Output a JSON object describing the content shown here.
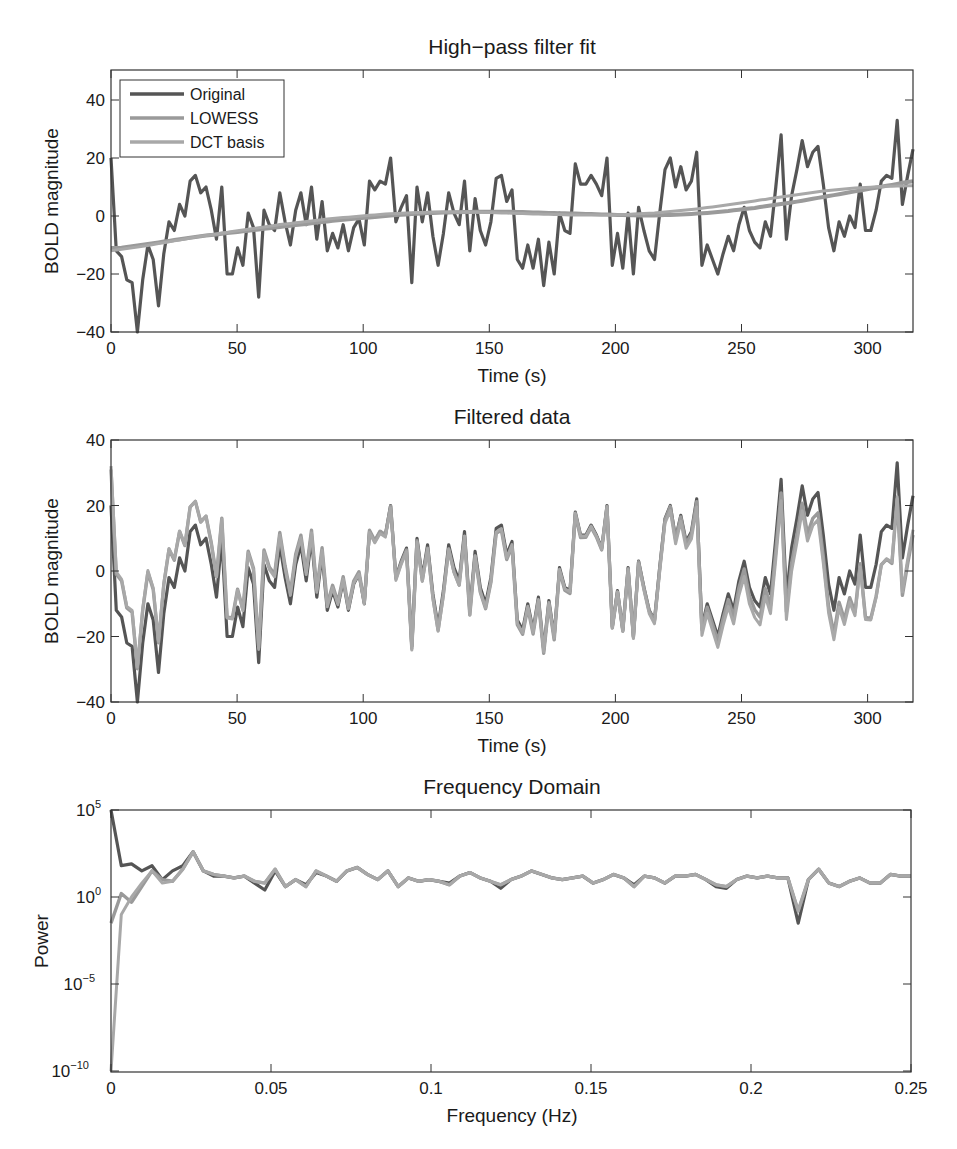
{
  "colors": {
    "original": "#555555",
    "lowess": "#9a9a9a",
    "dct": "#a8a8a8",
    "axis": "#333333"
  },
  "chart_data": [
    {
      "type": "line",
      "title": "High−pass filter fit",
      "xlabel": "Time (s)",
      "ylabel": "BOLD magnitude",
      "xlim": [
        0,
        318
      ],
      "ylim": [
        -40,
        50
      ],
      "xticks": [
        0,
        50,
        100,
        150,
        200,
        250,
        300
      ],
      "yticks": [
        -40,
        -20,
        0,
        20,
        40
      ],
      "grid": false,
      "legend": {
        "position": "upper left",
        "entries": [
          "Original",
          "LOWESS",
          "DCT basis"
        ]
      },
      "dt": 2.5,
      "series": [
        {
          "name": "Original",
          "values": [
            20,
            -12,
            -14,
            -22,
            -23,
            -40,
            -22,
            -10,
            -15,
            -31,
            -13,
            -2,
            -5,
            4,
            0,
            12,
            14,
            8,
            10,
            2,
            -8,
            10,
            -20,
            -20,
            -11,
            -17,
            1,
            -4,
            -28,
            2,
            -3,
            -5,
            8,
            -2,
            -10,
            2,
            8,
            -3,
            10,
            -8,
            5,
            -12,
            -6,
            -11,
            -3,
            -12,
            -4,
            -1,
            -10,
            12,
            9,
            12,
            11,
            20,
            -2,
            3,
            7,
            -23,
            10,
            -2,
            8,
            -7,
            -17,
            -6,
            8,
            1,
            -3,
            12,
            -12,
            6,
            -5,
            -10,
            -2,
            13,
            14,
            5,
            9,
            -15,
            -18,
            -10,
            -18,
            -8,
            -24,
            -9,
            -20,
            1,
            -5,
            -6,
            18,
            11,
            11,
            14,
            11,
            7,
            20,
            -17,
            -6,
            -18,
            1,
            -20,
            3,
            -5,
            -12,
            -15,
            1,
            16,
            20,
            10,
            17,
            9,
            12,
            22,
            -17,
            -10,
            -15,
            -20,
            -13,
            -7,
            -12,
            -3,
            3,
            -5,
            -9,
            -11,
            -2,
            -7,
            10,
            28,
            -8,
            7,
            16,
            26,
            17,
            22,
            24,
            11,
            -4,
            -12,
            -2,
            -7,
            0,
            -4,
            11,
            -5,
            -5,
            2,
            12,
            14,
            13,
            33,
            4,
            14,
            23
          ]
        },
        {
          "name": "LOWESS",
          "values": [
            -11,
            -11,
            -10.5,
            -10,
            -9.5,
            -9,
            -8.5,
            -8,
            -7.5,
            -7,
            -6.6,
            -6.2,
            -5.8,
            -5.4,
            -5,
            -4.6,
            -4.2,
            -3.8,
            -3.4,
            -3,
            -2.6,
            -2.2,
            -1.8,
            -1.4,
            -1.1,
            -0.8,
            -0.5,
            -0.2,
            0.1,
            0.4,
            0.6,
            0.8,
            1,
            1.1,
            1.2,
            1.3,
            1.4,
            1.5,
            1.5,
            1.5,
            1.5,
            1.4,
            1.3,
            1.2,
            1.1,
            1,
            0.9,
            0.8,
            0.7,
            0.6,
            0.5,
            0.4,
            0.3,
            0.2,
            0.2,
            0.2,
            0.3,
            0.4,
            0.6,
            0.8,
            1,
            1.3,
            1.6,
            2,
            2.4,
            2.8,
            3.3,
            3.8,
            4.3,
            4.8,
            5.4,
            6,
            6.6,
            7.2,
            7.8,
            8.4,
            9,
            9.6,
            10.2,
            10.8,
            11.5,
            12
          ]
        },
        {
          "name": "DCT basis",
          "values": [
            -12,
            -11.5,
            -11,
            -10.5,
            -10,
            -9.4,
            -8.8,
            -8.2,
            -7.6,
            -7,
            -6.5,
            -6,
            -5.5,
            -5,
            -4.5,
            -4,
            -3.5,
            -3,
            -2.6,
            -2.2,
            -1.8,
            -1.4,
            -1,
            -0.7,
            -0.4,
            -0.1,
            0.2,
            0.5,
            0.7,
            0.9,
            1.1,
            1.2,
            1.3,
            1.4,
            1.4,
            1.4,
            1.4,
            1.3,
            1.2,
            1.1,
            1,
            0.9,
            0.8,
            0.7,
            0.6,
            0.5,
            0.4,
            0.3,
            0.3,
            0.3,
            0.3,
            0.4,
            0.5,
            0.7,
            0.9,
            1.1,
            1.4,
            1.7,
            2,
            2.4,
            2.8,
            3.2,
            3.7,
            4.2,
            4.7,
            5.2,
            5.7,
            6.2,
            6.7,
            7.2,
            7.7,
            8.2,
            8.6,
            9,
            9.3,
            9.6,
            9.8,
            10,
            10.2,
            10.3,
            10.4,
            10.4
          ]
        }
      ]
    },
    {
      "type": "line",
      "title": "Filtered data",
      "xlabel": "Time (s)",
      "ylabel": "BOLD magnitude",
      "xlim": [
        0,
        318
      ],
      "ylim": [
        -40,
        40
      ],
      "xticks": [
        0,
        50,
        100,
        150,
        200,
        250,
        300
      ],
      "yticks": [
        -40,
        -20,
        0,
        20,
        40
      ],
      "grid": false,
      "note": "Series are Original minus LOWESS fit and Original minus DCT fit, overlaid with the Original."
    },
    {
      "type": "line",
      "title": "Frequency Domain",
      "xlabel": "Frequency (Hz)",
      "ylabel": "Power",
      "xscale": "linear",
      "yscale": "log",
      "xlim": [
        0,
        0.25
      ],
      "ylim_log10": [
        -10,
        5
      ],
      "xticks": [
        0,
        0.05,
        0.1,
        0.15,
        0.2,
        0.25
      ],
      "yticks_log10": [
        -10,
        -5,
        0,
        5
      ],
      "grid": false,
      "series": [
        {
          "name": "Original",
          "log10_power": [
            5,
            1.8,
            1.9,
            1.5,
            1.8,
            1,
            1.5,
            1.8,
            2.6,
            1.5,
            1.2,
            1.2,
            1.1,
            1.2,
            0.8,
            0.4,
            1.5,
            0.6,
            1,
            0.7,
            1.4,
            1.2,
            0.9,
            1.5,
            1.7,
            1.3,
            1,
            1.5,
            0.6,
            1.1,
            0.9,
            1,
            0.9,
            0.8,
            1.2,
            1.4,
            1.1,
            0.9,
            0.5,
            1,
            1.2,
            1.5,
            1.3,
            1.1,
            1,
            1.1,
            1.2,
            0.8,
            1,
            1.3,
            1.1,
            0.7,
            1.2,
            1.1,
            0.8,
            1.2,
            1.2,
            1.3,
            1,
            0.6,
            0.5,
            1,
            1.2,
            1.1,
            1.2,
            1.1,
            1.1,
            -1.5,
            1,
            1.6,
            0.8,
            0.6,
            0.9,
            1.1,
            0.8,
            0.8,
            1.3,
            1.2,
            1.2
          ]
        },
        {
          "name": "LOWESS",
          "log10_power": [
            -1.5,
            0.2,
            -0.3,
            0.6,
            1.5,
            1,
            0.9,
            1.6,
            2.6,
            1.5,
            1.3,
            1.2,
            1.1,
            1.2,
            0.9,
            0.8,
            1.6,
            0.6,
            1,
            0.6,
            1.5,
            1.2,
            0.9,
            1.5,
            1.7,
            1.3,
            1,
            1.5,
            0.6,
            1.1,
            0.9,
            1,
            0.9,
            0.7,
            1.2,
            1.4,
            1.1,
            0.9,
            0.7,
            1,
            1.2,
            1.5,
            1.3,
            1.1,
            1,
            1.1,
            1.2,
            0.8,
            1,
            1.3,
            1.1,
            0.6,
            1.2,
            1.1,
            0.8,
            1.2,
            1.2,
            1.3,
            1,
            0.7,
            0.6,
            1,
            1.2,
            1.1,
            1.2,
            1.1,
            1.1,
            -0.8,
            1,
            1.6,
            0.8,
            0.6,
            0.9,
            1.1,
            0.8,
            0.8,
            1.3,
            1.2,
            1.2
          ]
        },
        {
          "name": "DCT basis",
          "log10_power": [
            -10,
            -1,
            0,
            0.8,
            1.5,
            0.8,
            0.9,
            1.6,
            2.6,
            1.5,
            1.3,
            1.2,
            1.1,
            1.2,
            0.9,
            0.8,
            1.6,
            0.6,
            1,
            0.6,
            1.5,
            1.2,
            0.9,
            1.5,
            1.7,
            1.3,
            1,
            1.5,
            0.6,
            1.1,
            0.9,
            1,
            0.9,
            0.7,
            1.2,
            1.4,
            1.1,
            0.9,
            0.7,
            1,
            1.2,
            1.5,
            1.3,
            1.1,
            1,
            1.1,
            1.2,
            0.8,
            1,
            1.3,
            1.1,
            0.6,
            1.2,
            1.1,
            0.8,
            1.2,
            1.2,
            1.3,
            1,
            0.7,
            0.6,
            1,
            1.2,
            1.1,
            1.2,
            1.1,
            1.1,
            -0.8,
            1,
            1.6,
            0.8,
            0.6,
            0.9,
            1.1,
            0.8,
            0.8,
            1.3,
            1.2,
            1.2
          ]
        }
      ]
    }
  ],
  "plots": [
    {
      "title": "High−pass filter fit",
      "xlabel": "Time (s)",
      "ylabel": "BOLD magnitude",
      "xticks": [
        "0",
        "50",
        "100",
        "150",
        "200",
        "250",
        "300"
      ],
      "yticks": [
        "40",
        "20",
        "0",
        "−20",
        "−40"
      ]
    },
    {
      "title": "Filtered data",
      "xlabel": "Time (s)",
      "ylabel": "BOLD magnitude",
      "xticks": [
        "0",
        "50",
        "100",
        "150",
        "200",
        "250",
        "300"
      ],
      "yticks": [
        "40",
        "20",
        "0",
        "−20",
        "−40"
      ]
    },
    {
      "title": "Frequency Domain",
      "xlabel": "Frequency (Hz)",
      "ylabel": "Power",
      "xticks": [
        "0",
        "0.05",
        "0.1",
        "0.15",
        "0.2",
        "0.25"
      ],
      "yticks": [
        "5",
        "0",
        "−5",
        "−10"
      ]
    }
  ],
  "legend": [
    {
      "label": "Original"
    },
    {
      "label": "LOWESS"
    },
    {
      "label": "DCT basis"
    }
  ]
}
